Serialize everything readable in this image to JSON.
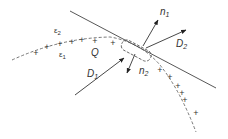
{
  "diagram": {
    "type": "boundary-condition-pillbox",
    "labels": {
      "epsilon2": "ε",
      "epsilon2_sub": "2",
      "epsilon1": "ε",
      "epsilon1_sub": "1",
      "charge_region": "Q",
      "d1": "D",
      "d1_sub": "1",
      "d2": "D",
      "d2_sub": "2",
      "n1": "n",
      "n1_sub": "1",
      "n2": "n",
      "n2_sub": "2"
    },
    "charge_symbol": "+",
    "colors": {
      "stroke": "#444444",
      "dashed": "#666666",
      "text": "#333333"
    }
  }
}
